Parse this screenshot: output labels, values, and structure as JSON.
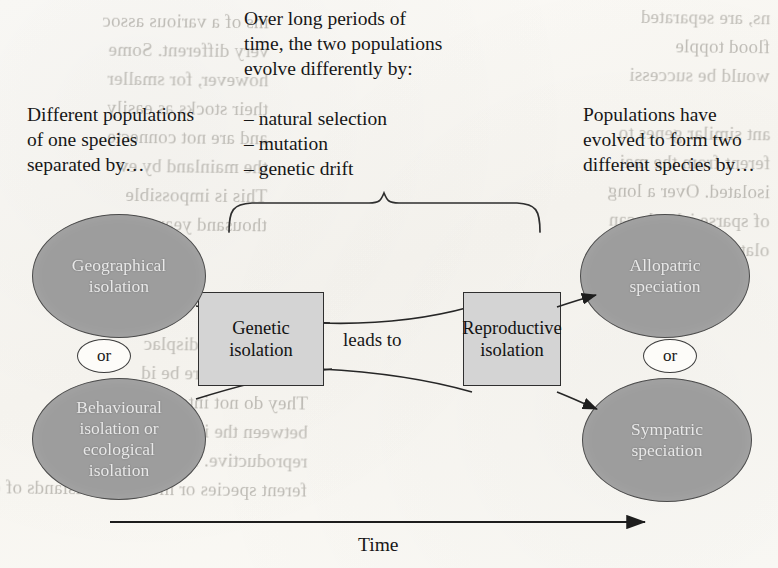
{
  "figure": {
    "type": "speciation-flow-diagram",
    "axis_label": "Time",
    "connector_label": "leads to",
    "or_label": "or"
  },
  "left_caption": "Different populations\nof one species\nseparated by…",
  "center_caption": {
    "intro": "Over long periods of\ntime, the two populations\nevolve differently by:",
    "bullets": [
      "– natural selection",
      "– mutation",
      "– genetic drift"
    ]
  },
  "right_caption": "Populations have\nevolved to form two\ndifferent species by…",
  "nodes": {
    "left": [
      {
        "id": "geographical-isolation",
        "label": "Geographical\nisolation"
      },
      {
        "id": "behavioural-ecological-isolation",
        "label": "Behavioural\nisolation or\necological\nisolation"
      }
    ],
    "center": [
      {
        "id": "genetic-isolation",
        "label": "Genetic\nisolation"
      },
      {
        "id": "reproductive-isolation",
        "label": "Reproductive\nisolation"
      }
    ],
    "right": [
      {
        "id": "allopatric-speciation",
        "label": "Allopatric\nspeciation"
      },
      {
        "id": "sympatric-speciation",
        "label": "Sympatric\nspeciation"
      }
    ]
  },
  "colors": {
    "page": "#fbfaf7",
    "ellipse_fill": "#9d9d9d",
    "ellipse_stroke": "#4b4b4b",
    "ellipse_text": "#efefef",
    "box_fill": "#d4d4d4",
    "box_stroke": "#2f2f2f",
    "ink": "#171717",
    "ghost_ink": "#9d9a93"
  },
  "bleed_through": {
    "note": "faint mirrored text from the reverse side of the scanned page",
    "top_right": "ns, are separated\nflood topple\nwould be successi",
    "left_column": "ins of a various assoc\nvery different. Some\nhowever, for smaller\ntheir stocks as easily\nand are not connecte\nthe mainland by ev\nThis is impossible\nthousand years, which",
    "right_column": "ant similar genes to\nferent from the mai\nisolated. Over a long\nof sparse islands can\nolated populations o",
    "lower_left": "e species in a\nthey could be displac\nwould therefore be id\nThey do not inter-\nbetween the islands if\nreproductive. I can tell there\nferent species or men, of the islands of different habi"
  }
}
